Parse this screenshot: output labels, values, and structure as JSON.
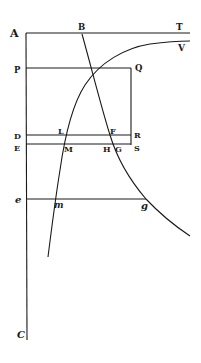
{
  "diagram": {
    "type": "geometric-figure",
    "stroke_color": "#1a1a1a",
    "background": "#ffffff",
    "labels": {
      "A": "A",
      "B": "B",
      "T": "T",
      "V": "V",
      "P": "P",
      "Q": "Q",
      "D": "D",
      "L": "L",
      "F": "F",
      "R": "R",
      "E": "E",
      "M": "M",
      "H": "H",
      "G": "G",
      "S": "S",
      "e": "e",
      "m": "m",
      "g": "g",
      "C": "C"
    },
    "points": {
      "A": [
        26,
        33
      ],
      "T": [
        190,
        33
      ],
      "B": [
        82,
        33
      ],
      "P": [
        26,
        68
      ],
      "Q": [
        131,
        68
      ],
      "D": [
        26,
        136
      ],
      "R": [
        131,
        136
      ],
      "E": [
        26,
        145
      ],
      "S": [
        131,
        145
      ],
      "e": [
        26,
        200
      ],
      "g": [
        146,
        200
      ],
      "C": [
        26,
        340
      ]
    },
    "lines": [
      {
        "name": "AT",
        "from": "A",
        "to": "T"
      },
      {
        "name": "AC",
        "from": "A",
        "to": "C"
      },
      {
        "name": "PQ",
        "from": "P",
        "to": "Q"
      },
      {
        "name": "QS",
        "from": "Q",
        "to": "S"
      },
      {
        "name": "DR",
        "from": "D",
        "to": "R"
      },
      {
        "name": "ES",
        "from": "E",
        "to": "S"
      },
      {
        "name": "eg",
        "from": "e",
        "to": "g"
      }
    ],
    "curves": [
      {
        "name": "hyperbola-BFGg",
        "description": "descending curve from B through F, G, g"
      },
      {
        "name": "curve-mMLV",
        "description": "ascending curve through m, M, L approaching asymptote toward V"
      }
    ]
  }
}
